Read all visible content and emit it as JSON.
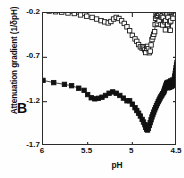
{
  "chart_data": {
    "type": "line",
    "title": "",
    "panel_label": "B",
    "xlabel": "pH",
    "ylabel": "Attenuation gradient (1/δpH)",
    "xlim": [
      6.0,
      4.5
    ],
    "ylim": [
      -1.7,
      -0.2
    ],
    "x_ticks": [
      6,
      5.5,
      5,
      4.5
    ],
    "x_tick_labels": [
      "6",
      "5.5",
      "5",
      "4.5"
    ],
    "y_ticks": [
      -0.2,
      -0.7,
      -1.2,
      -1.7
    ],
    "y_tick_labels": [
      "-0.2",
      "-0.7",
      "-1.2",
      "-1.7"
    ],
    "x_axis_inverted": true,
    "grid": false,
    "legend": null,
    "marker_size_px": 4.4,
    "series": [
      {
        "name": "open-squares",
        "marker": "square-open",
        "color": "#111111",
        "fill": "#ffffff",
        "points": [
          [
            6.0,
            -0.165
          ],
          [
            5.93,
            -0.178
          ],
          [
            5.86,
            -0.186
          ],
          [
            5.79,
            -0.19
          ],
          [
            5.72,
            -0.2
          ],
          [
            5.65,
            -0.206
          ],
          [
            5.58,
            -0.222
          ],
          [
            5.51,
            -0.236
          ],
          [
            5.45,
            -0.25
          ],
          [
            5.4,
            -0.268
          ],
          [
            5.35,
            -0.286
          ],
          [
            5.31,
            -0.3
          ],
          [
            5.27,
            -0.312
          ],
          [
            5.24,
            -0.296
          ],
          [
            5.21,
            -0.268
          ],
          [
            5.18,
            -0.25
          ],
          [
            5.15,
            -0.262
          ],
          [
            5.12,
            -0.288
          ],
          [
            5.09,
            -0.318
          ],
          [
            5.06,
            -0.356
          ],
          [
            5.03,
            -0.4
          ],
          [
            5.0,
            -0.452
          ],
          [
            4.97,
            -0.492
          ],
          [
            4.95,
            -0.52
          ],
          [
            4.93,
            -0.556
          ],
          [
            4.91,
            -0.582
          ],
          [
            4.89,
            -0.596
          ],
          [
            4.88,
            -0.58
          ],
          [
            4.87,
            -0.596
          ],
          [
            4.86,
            -0.616
          ],
          [
            4.85,
            -0.646
          ],
          [
            4.84,
            -0.6
          ],
          [
            4.83,
            -0.576
          ],
          [
            4.82,
            -0.604
          ],
          [
            4.81,
            -0.648
          ],
          [
            4.8,
            -0.63
          ],
          [
            4.79,
            -0.56
          ],
          [
            4.78,
            -0.5
          ],
          [
            4.77,
            -0.47
          ],
          [
            4.76,
            -0.44
          ],
          [
            4.75,
            -0.41
          ],
          [
            4.745,
            -0.33
          ],
          [
            4.74,
            -0.26
          ],
          [
            4.735,
            -0.2
          ],
          [
            4.73,
            -0.15
          ],
          [
            4.725,
            -0.235
          ],
          [
            4.72,
            -0.32
          ],
          [
            4.715,
            -0.225
          ],
          [
            4.71,
            -0.14
          ],
          [
            4.705,
            -0.205
          ],
          [
            4.7,
            -0.29
          ],
          [
            4.695,
            -0.18
          ],
          [
            4.69,
            -0.125
          ],
          [
            4.685,
            -0.215
          ],
          [
            4.68,
            -0.33
          ],
          [
            4.675,
            -0.245
          ],
          [
            4.67,
            -0.15
          ],
          [
            4.665,
            -0.23
          ],
          [
            4.66,
            -0.335
          ],
          [
            4.655,
            -0.25
          ],
          [
            4.65,
            -0.165
          ],
          [
            4.645,
            -0.1
          ],
          [
            4.64,
            -0.195
          ],
          [
            4.635,
            -0.3
          ],
          [
            4.63,
            -0.39
          ],
          [
            4.625,
            -0.285
          ],
          [
            4.62,
            -0.18
          ],
          [
            4.615,
            -0.11
          ],
          [
            4.61,
            -0.215
          ],
          [
            4.605,
            -0.33
          ],
          [
            4.6,
            -0.25
          ],
          [
            4.595,
            -0.16
          ],
          [
            4.59,
            -0.095
          ],
          [
            4.585,
            -0.19
          ],
          [
            4.58,
            -0.3
          ],
          [
            4.575,
            -0.395
          ],
          [
            4.57,
            -0.29
          ],
          [
            4.565,
            -0.185
          ],
          [
            4.56,
            -0.105
          ],
          [
            4.555,
            -0.075
          ],
          [
            4.55,
            -0.15
          ],
          [
            4.545,
            -0.26
          ],
          [
            4.54,
            -0.175
          ],
          [
            4.535,
            -0.09
          ],
          [
            4.53,
            -0.062
          ]
        ]
      },
      {
        "name": "filled-squares",
        "marker": "square-filled",
        "color": "#111111",
        "fill": "#111111",
        "points": [
          [
            6.0,
            -0.96
          ],
          [
            5.88,
            -0.985
          ],
          [
            5.76,
            -1.005
          ],
          [
            5.68,
            -1.02
          ],
          [
            5.6,
            -1.048
          ],
          [
            5.54,
            -1.072
          ],
          [
            5.5,
            -1.12
          ],
          [
            5.46,
            -1.156
          ],
          [
            5.42,
            -1.168
          ],
          [
            5.38,
            -1.162
          ],
          [
            5.34,
            -1.15
          ],
          [
            5.3,
            -1.13
          ],
          [
            5.26,
            -1.105
          ],
          [
            5.22,
            -1.09
          ],
          [
            5.18,
            -1.105
          ],
          [
            5.14,
            -1.13
          ],
          [
            5.1,
            -1.16
          ],
          [
            5.06,
            -1.19
          ],
          [
            5.03,
            -1.19
          ],
          [
            5.0,
            -1.228
          ],
          [
            4.97,
            -1.268
          ],
          [
            4.95,
            -1.3
          ],
          [
            4.93,
            -1.33
          ],
          [
            4.91,
            -1.362
          ],
          [
            4.89,
            -1.4
          ],
          [
            4.875,
            -1.43
          ],
          [
            4.86,
            -1.46
          ],
          [
            4.85,
            -1.49
          ],
          [
            4.84,
            -1.512
          ],
          [
            4.83,
            -1.52
          ],
          [
            4.82,
            -1.5
          ],
          [
            4.81,
            -1.468
          ],
          [
            4.8,
            -1.436
          ],
          [
            4.79,
            -1.404
          ],
          [
            4.78,
            -1.372
          ],
          [
            4.77,
            -1.345
          ],
          [
            4.76,
            -1.318
          ],
          [
            4.75,
            -1.292
          ],
          [
            4.74,
            -1.268
          ],
          [
            4.73,
            -1.245
          ],
          [
            4.72,
            -1.222
          ],
          [
            4.71,
            -1.2
          ],
          [
            4.7,
            -1.18
          ],
          [
            4.69,
            -1.16
          ],
          [
            4.68,
            -1.142
          ],
          [
            4.67,
            -1.126
          ],
          [
            4.66,
            -1.11
          ],
          [
            4.65,
            -1.095
          ],
          [
            4.645,
            -1.08
          ],
          [
            4.64,
            -1.066
          ],
          [
            4.635,
            -1.05
          ],
          [
            4.63,
            -1.036
          ],
          [
            4.625,
            -1.022
          ],
          [
            4.62,
            -1.008
          ],
          [
            4.615,
            -0.996
          ],
          [
            4.61,
            -0.984
          ],
          [
            4.605,
            -1.012
          ],
          [
            4.6,
            -1.044
          ],
          [
            4.595,
            -1.01
          ],
          [
            4.59,
            -0.978
          ],
          [
            4.585,
            -1.006
          ],
          [
            4.58,
            -1.038
          ],
          [
            4.575,
            -1.0
          ],
          [
            4.57,
            -0.966
          ],
          [
            4.565,
            -0.996
          ],
          [
            4.56,
            -1.028
          ],
          [
            4.555,
            -0.99
          ],
          [
            4.55,
            -0.956
          ],
          [
            4.545,
            -0.986
          ],
          [
            4.54,
            -1.016
          ],
          [
            4.535,
            -0.98
          ],
          [
            4.53,
            -0.944
          ],
          [
            4.525,
            -0.912
          ],
          [
            4.52,
            -0.88
          ],
          [
            4.515,
            -0.848
          ],
          [
            4.51,
            -0.816
          ],
          [
            4.505,
            -0.786
          ],
          [
            4.5,
            -0.758
          ]
        ]
      }
    ]
  }
}
